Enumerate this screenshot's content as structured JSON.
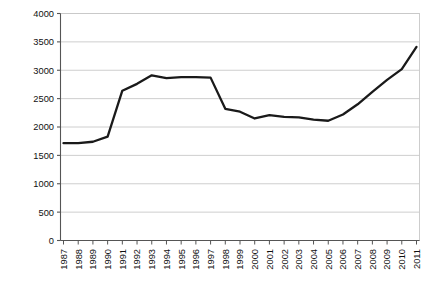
{
  "chart_data": {
    "type": "line",
    "title": "",
    "subtitle": "",
    "xlabel": "",
    "ylabel": "$ million",
    "ylim": [
      0,
      4000
    ],
    "ytick_step": 500,
    "ytick_labels": [
      "0",
      "500",
      "1000",
      "1500",
      "2000",
      "2500",
      "3000",
      "3500",
      "4000"
    ],
    "grid": "horizontal",
    "legend": "none",
    "line_color": "#1a1a1a",
    "grid_color": "#c8c8c8",
    "axis_color": "#555555",
    "categories": [
      "1987",
      "1988",
      "1989",
      "1990",
      "1991",
      "1992",
      "1993",
      "1994",
      "1995",
      "1996",
      "1997",
      "1998",
      "1999",
      "2000",
      "2001",
      "2002",
      "2003",
      "2004",
      "2005",
      "2006",
      "2007",
      "2008",
      "2009",
      "2010",
      "2011"
    ],
    "series": [
      {
        "name": "$ million",
        "values": [
          1715,
          1715,
          1740,
          1830,
          2640,
          2760,
          2910,
          2860,
          2880,
          2880,
          2870,
          2320,
          2270,
          2150,
          2210,
          2180,
          2170,
          2130,
          2110,
          2220,
          2400,
          2620,
          2830,
          3020,
          3410
        ]
      }
    ]
  }
}
